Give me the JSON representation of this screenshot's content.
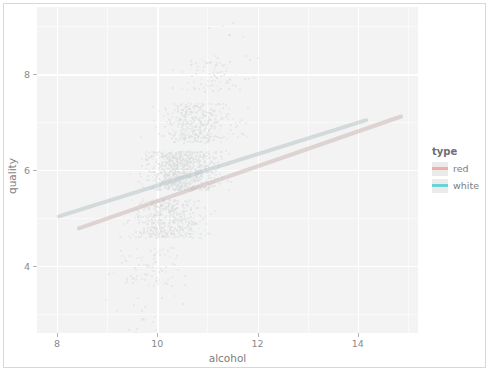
{
  "chart_data": {
    "type": "scatter",
    "title": "",
    "subtitle": "",
    "xlabel": "alcohol",
    "ylabel": "quality",
    "xlim": [
      7.6,
      15.2
    ],
    "ylim": [
      2.6,
      9.4
    ],
    "xticks": [
      8,
      10,
      12,
      14
    ],
    "xtick_labels": [
      "8",
      "10",
      "12",
      "14"
    ],
    "yticks": [
      4,
      6,
      8
    ],
    "ytick_labels": [
      "4",
      "6",
      "8"
    ],
    "x_minor_ticks": [
      9,
      11,
      13,
      15
    ],
    "y_minor_ticks": [
      3,
      5,
      7,
      9
    ],
    "grid": true,
    "grid_color": "#ffffff",
    "panel_background": "#ebebeb",
    "jitter": true,
    "legend": {
      "title": "type",
      "position": "right",
      "entries": [
        {
          "label": "red",
          "color": "#f8766d"
        },
        {
          "label": "white",
          "color": "#00bfc4"
        }
      ]
    },
    "series": [
      {
        "name": "red",
        "color": "#f8766d",
        "point_count": 1599,
        "quality_levels": [
          3,
          4,
          5,
          6,
          7,
          8
        ],
        "trendline": {
          "type": "lm",
          "x": [
            8.4,
            14.9
          ],
          "y": [
            4.77,
            7.13
          ]
        }
      },
      {
        "name": "white",
        "color": "#00bfc4",
        "point_count": 4898,
        "quality_levels": [
          3,
          4,
          5,
          6,
          7,
          8,
          9
        ],
        "trendline": {
          "type": "lm",
          "x": [
            8.0,
            14.2
          ],
          "y": [
            5.03,
            7.06
          ]
        }
      }
    ],
    "density_by_quality": [
      {
        "quality": 3,
        "weight": 0.02
      },
      {
        "quality": 4,
        "weight": 0.1
      },
      {
        "quality": 5,
        "weight": 0.55
      },
      {
        "quality": 6,
        "weight": 1.0
      },
      {
        "quality": 7,
        "weight": 0.45
      },
      {
        "quality": 8,
        "weight": 0.1
      },
      {
        "quality": 9,
        "weight": 0.01
      }
    ]
  }
}
